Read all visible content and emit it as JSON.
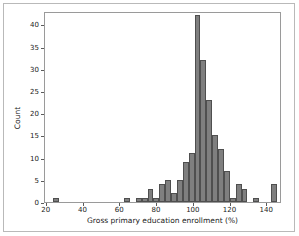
{
  "figure": {
    "background": "#ffffff",
    "frame_color": "#b9b9b9",
    "axes_color": "#9a9a9a"
  },
  "chart_data": {
    "type": "bar",
    "subtype": "histogram",
    "title": "",
    "xlabel": "Gross primary education enrollment (%)",
    "ylabel": "Count",
    "xlim": [
      19,
      148
    ],
    "ylim": [
      0,
      43
    ],
    "xticks": [
      20,
      40,
      60,
      80,
      100,
      120,
      140
    ],
    "yticks": [
      0,
      5,
      10,
      15,
      20,
      25,
      30,
      35,
      40
    ],
    "xticklabels": [
      "20",
      "40",
      "60",
      "80",
      "100",
      "120",
      "140"
    ],
    "yticklabels": [
      "0",
      "5",
      "10",
      "15",
      "20",
      "25",
      "30",
      "35",
      "40"
    ],
    "grid": false,
    "legend": null,
    "bar_color": "#7f7f7f",
    "bar_edge_color": "#4f4f4f",
    "bin_width": 3.2,
    "bins": [
      {
        "left": 23.6,
        "value": 1
      },
      {
        "left": 26.8,
        "value": 0
      },
      {
        "left": 30.0,
        "value": 0
      },
      {
        "left": 33.2,
        "value": 0
      },
      {
        "left": 36.4,
        "value": 0
      },
      {
        "left": 39.6,
        "value": 0
      },
      {
        "left": 42.8,
        "value": 0
      },
      {
        "left": 46.0,
        "value": 0
      },
      {
        "left": 49.2,
        "value": 0
      },
      {
        "left": 52.4,
        "value": 0
      },
      {
        "left": 55.6,
        "value": 0
      },
      {
        "left": 58.8,
        "value": 0
      },
      {
        "left": 62.0,
        "value": 1
      },
      {
        "left": 65.2,
        "value": 0
      },
      {
        "left": 68.4,
        "value": 1
      },
      {
        "left": 71.6,
        "value": 1
      },
      {
        "left": 74.8,
        "value": 3
      },
      {
        "left": 78.0,
        "value": 1
      },
      {
        "left": 81.2,
        "value": 4
      },
      {
        "left": 84.4,
        "value": 5
      },
      {
        "left": 87.6,
        "value": 2
      },
      {
        "left": 90.8,
        "value": 5
      },
      {
        "left": 94.0,
        "value": 9
      },
      {
        "left": 97.2,
        "value": 11
      },
      {
        "left": 100.4,
        "value": 42
      },
      {
        "left": 103.6,
        "value": 32
      },
      {
        "left": 106.8,
        "value": 23
      },
      {
        "left": 110.0,
        "value": 15
      },
      {
        "left": 113.2,
        "value": 12
      },
      {
        "left": 116.4,
        "value": 7
      },
      {
        "left": 119.6,
        "value": 1
      },
      {
        "left": 122.8,
        "value": 4
      },
      {
        "left": 126.0,
        "value": 3
      },
      {
        "left": 129.2,
        "value": 0
      },
      {
        "left": 132.4,
        "value": 1
      },
      {
        "left": 135.6,
        "value": 0
      },
      {
        "left": 138.8,
        "value": 0
      },
      {
        "left": 142.0,
        "value": 4
      }
    ]
  }
}
